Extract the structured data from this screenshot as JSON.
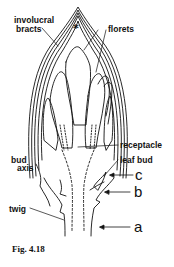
{
  "figure": {
    "caption": "Fig. 4.18",
    "apex_marker": "*",
    "labels": {
      "involucral_line1": "involucral",
      "involucral_line2": "bracts",
      "florets": "florets",
      "receptacle": "receptacle",
      "leaf_bud": "leaf bud",
      "bud_axis_line1": "bud",
      "bud_axis_line2": "axis",
      "twig": "twig"
    },
    "arrow_labels": {
      "a": "a",
      "b": "b",
      "c": "c"
    },
    "colors": {
      "ink": "#111111",
      "background": "#ffffff"
    }
  }
}
